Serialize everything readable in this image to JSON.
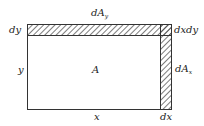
{
  "diagram": {
    "type": "area-differential",
    "labels": {
      "top_strip": "dA",
      "top_strip_sub": "y",
      "right_strip": "dA",
      "right_strip_sub": "x",
      "corner": "dxdy",
      "height_strip": "dy",
      "height": "y",
      "area": "A",
      "width": "x",
      "width_strip": "dx"
    },
    "colors": {
      "stroke": "#333333",
      "hatch": "#444444",
      "background": "#ffffff"
    }
  }
}
